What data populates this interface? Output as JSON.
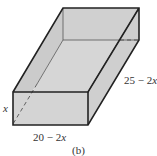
{
  "diagram": {
    "type": "open-box-3d",
    "labels": {
      "height": "x",
      "width_num": "20 − 2",
      "width_var": "x",
      "depth_num": "25 − 2",
      "depth_var": "x",
      "caption": "(b)"
    },
    "colors": {
      "face": "#d4d4d4",
      "face_dark": "#c8c8c8",
      "edge": "#222222",
      "hidden_edge": "#444444"
    }
  }
}
